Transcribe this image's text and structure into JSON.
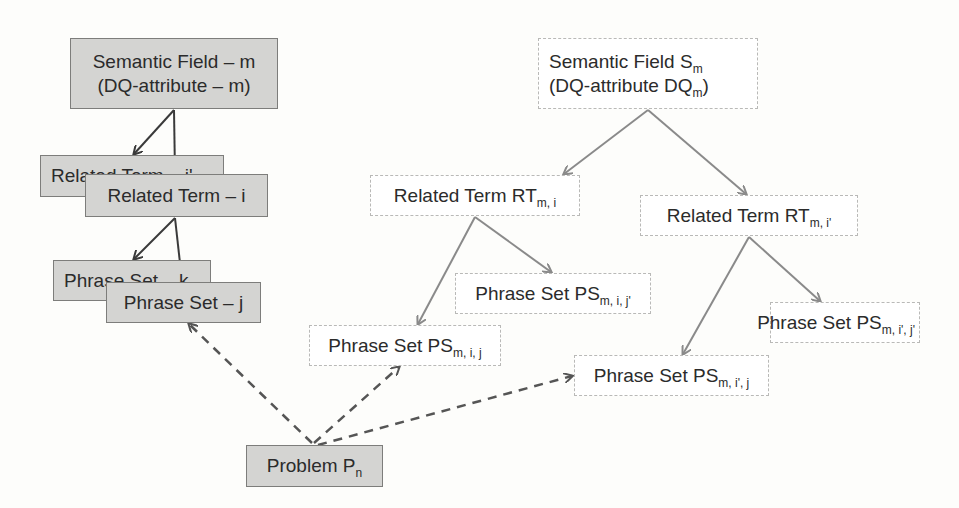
{
  "left_tree": {
    "root": {
      "line1": "Semantic Field – m",
      "line2": "(DQ-attribute – m)"
    },
    "related_term_back": {
      "label": "Related Term – i'"
    },
    "related_term_front": {
      "label": "Related Term – i"
    },
    "phrase_set_back": {
      "label": "Phrase Set – k"
    },
    "phrase_set_front": {
      "label": "Phrase Set – j"
    }
  },
  "problem": {
    "label": "Problem P",
    "sub": "n"
  },
  "right_tree": {
    "root": {
      "line1": "Semantic Field S",
      "line1_sub": "m",
      "line2": "(DQ-attribute DQ",
      "line2_sub": "m",
      "line2_end": ")"
    },
    "rt_i": {
      "label": "Related Term RT",
      "sub": "m, i"
    },
    "rt_i_prime": {
      "label": "Related Term RT",
      "sub": "m, i'"
    },
    "ps_i_j_prime": {
      "label": "Phrase Set PS",
      "sub": "m, i, j'"
    },
    "ps_i_j": {
      "label": "Phrase Set PS",
      "sub": "m, i, j"
    },
    "ps_i_prime_j_prime": {
      "label": "Phrase Set PS",
      "sub": "m, i', j'"
    },
    "ps_i_prime_j": {
      "label": "Phrase Set PS",
      "sub": "m, i', j"
    }
  },
  "colors": {
    "gray_fill": "#d4d4d2",
    "solid_arrow_left": "#3a3a3a",
    "solid_arrow_right": "#8a8a8a",
    "dashed_arrow": "#555555"
  }
}
